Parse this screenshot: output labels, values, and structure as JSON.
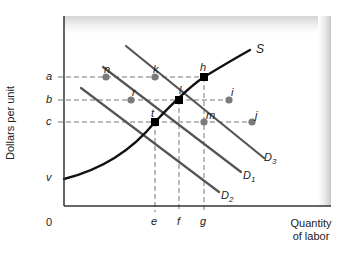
{
  "diagram": {
    "y_axis_label": "Dollars per unit",
    "x_axis_label_line1": "Quantity",
    "x_axis_label_line2": "of labor",
    "origin_label": "0",
    "price_levels": [
      {
        "label": "a",
        "y": 77
      },
      {
        "label": "b",
        "y": 100
      },
      {
        "label": "c",
        "y": 122
      },
      {
        "label": "v",
        "y": 179
      }
    ],
    "quantity_levels": [
      {
        "label": "e",
        "x": 155
      },
      {
        "label": "f",
        "x": 179
      },
      {
        "label": "g",
        "x": 204
      }
    ],
    "curves": {
      "supply": {
        "label": "S"
      },
      "demand": [
        {
          "label": "D",
          "subscript": "1"
        },
        {
          "label": "D",
          "subscript": "2"
        },
        {
          "label": "D",
          "subscript": "3"
        }
      ]
    },
    "points": [
      {
        "label": "n",
        "kind": "gray"
      },
      {
        "label": "k",
        "kind": "gray"
      },
      {
        "label": "h",
        "kind": "black"
      },
      {
        "label": "r",
        "kind": "gray"
      },
      {
        "label": "l",
        "kind": "black"
      },
      {
        "label": "i",
        "kind": "gray"
      },
      {
        "label": "t",
        "kind": "black"
      },
      {
        "label": "m",
        "kind": "gray"
      },
      {
        "label": "j",
        "kind": "gray"
      }
    ],
    "colors": {
      "supply_curve": "#111111",
      "demand_curves": "#555555",
      "gray_points": "#7a7a7a",
      "black_points": "#000000",
      "dashed_lines": "#777777",
      "axes": "#333333"
    }
  }
}
